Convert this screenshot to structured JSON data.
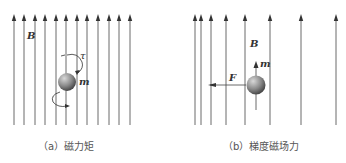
{
  "panels": [
    {
      "id": "a",
      "caption": "（a）磁力矩",
      "field_label": "B",
      "torque_label": "τ",
      "moment_label": "m",
      "field_lines_x": [
        14,
        24,
        35,
        45,
        56,
        66,
        77,
        87,
        98,
        109,
        119,
        130
      ]
    },
    {
      "id": "b",
      "caption": "（b）梯度磁场力",
      "field_label": "B",
      "moment_label": "m",
      "force_label": "F",
      "field_lines_x": [
        195,
        201,
        211,
        226,
        245,
        270,
        301,
        336
      ]
    }
  ],
  "colors": {
    "line": "#444444",
    "ball": "#8a8a8a"
  }
}
